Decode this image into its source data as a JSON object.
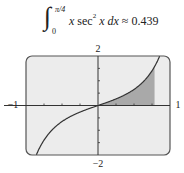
{
  "formula": {
    "integral_sign": "∫",
    "upper_limit": "π/4",
    "lower_limit": "0",
    "integrand_var1": "x",
    "integrand_fn": "sec",
    "integrand_exp": "2",
    "integrand_var2": "x",
    "differential": "dx",
    "approx_symbol": "≈",
    "value": "0.439"
  },
  "chart_data": {
    "type": "line",
    "function": "y = x·sec²(x)",
    "xlim": [
      -1,
      1
    ],
    "ylim": [
      -2,
      2
    ],
    "x_tick_step": 0.25,
    "y_tick_step": 0.5,
    "tick_labels": {
      "x_min": "−1",
      "x_max": "1",
      "y_min": "−2",
      "y_max": "2"
    },
    "shaded_region": {
      "from": 0,
      "to": 0.7854,
      "label": "area ≈ 0.439"
    },
    "grid": false,
    "colors": {
      "screen_bg": "#ececec",
      "screen_border": "#555555",
      "curve": "#333333",
      "shade": "#a9a9a9",
      "axis": "#333333"
    }
  }
}
